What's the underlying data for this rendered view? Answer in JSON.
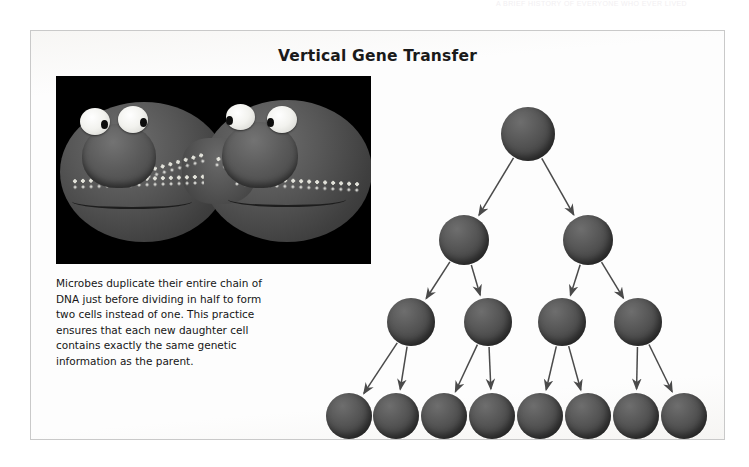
{
  "running_header": {
    "text": "A BRIEF HISTORY OF EVERYONE WHO EVER LIVED"
  },
  "figure": {
    "title": "Vertical Gene Transfer",
    "caption": "Microbes duplicate their entire chain of DNA just before dividing in half to form two cells instead of one. This practice ensures that each new daughter cell contains exactly the same genetic information as the parent.",
    "frame_border_color": "#c9c9c9",
    "background_color": "#fdfdfd"
  },
  "photo": {
    "alt_name": "dividing-microbe-model-photograph",
    "background_color": "#000000",
    "subject": "clay model of a microbe splitting into two cells, each with two eyes, a snout and a mouth, with white DNA strands inside",
    "features": {
      "eyes": 4,
      "mouths": 2,
      "dna_strands": 4,
      "cell_lobes": 2
    }
  },
  "diagram": {
    "name": "vertical-gene-transfer-lineage-tree",
    "type": "binary-lineage-tree",
    "generations": 4,
    "cell_color": "#5a5a5a",
    "arrow_color": "#4a4a4a",
    "rows": [
      {
        "generation": 1,
        "count": 1,
        "cells_x": [
          252
        ],
        "cell_y": 75,
        "radius": 27
      },
      {
        "generation": 2,
        "count": 2,
        "cells_x": [
          188,
          312
        ],
        "cell_y": 181,
        "radius": 25
      },
      {
        "generation": 3,
        "count": 4,
        "cells_x": [
          135,
          212,
          286,
          362
        ],
        "cell_y": 263,
        "radius": 24
      },
      {
        "generation": 4,
        "count": 8,
        "cells_x": [
          73,
          120,
          168,
          216,
          264,
          312,
          360,
          408
        ],
        "cell_y": 357,
        "radius": 23
      }
    ],
    "edges": [
      {
        "from": [
          252,
          75
        ],
        "to": [
          188,
          181
        ]
      },
      {
        "from": [
          252,
          75
        ],
        "to": [
          312,
          181
        ]
      },
      {
        "from": [
          188,
          181
        ],
        "to": [
          135,
          263
        ]
      },
      {
        "from": [
          188,
          181
        ],
        "to": [
          212,
          263
        ]
      },
      {
        "from": [
          312,
          181
        ],
        "to": [
          286,
          263
        ]
      },
      {
        "from": [
          312,
          181
        ],
        "to": [
          362,
          263
        ]
      },
      {
        "from": [
          135,
          263
        ],
        "to": [
          73,
          357
        ]
      },
      {
        "from": [
          135,
          263
        ],
        "to": [
          120,
          357
        ]
      },
      {
        "from": [
          212,
          263
        ],
        "to": [
          168,
          357
        ]
      },
      {
        "from": [
          212,
          263
        ],
        "to": [
          216,
          357
        ]
      },
      {
        "from": [
          286,
          263
        ],
        "to": [
          264,
          357
        ]
      },
      {
        "from": [
          286,
          263
        ],
        "to": [
          312,
          357
        ]
      },
      {
        "from": [
          362,
          263
        ],
        "to": [
          360,
          357
        ]
      },
      {
        "from": [
          362,
          263
        ],
        "to": [
          408,
          357
        ]
      }
    ]
  }
}
